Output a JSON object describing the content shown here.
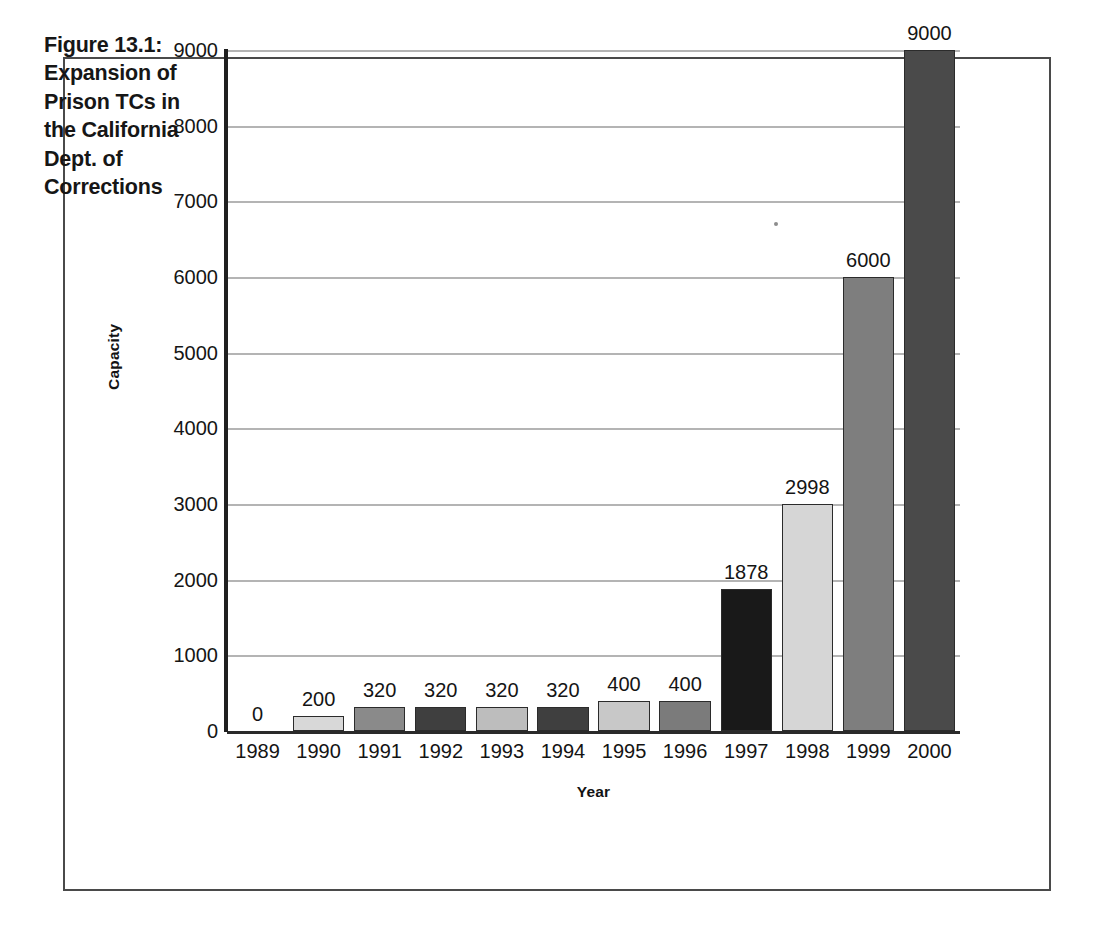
{
  "figure": {
    "title": "Figure 13.1: Expansion of Prison TCs in the California Dept. of Corrections"
  },
  "chart_data": {
    "type": "bar",
    "title": "Figure 13.1: Expansion of Prison TCs in the California Dept. of Corrections",
    "xlabel": "Year",
    "ylabel": "Capacity",
    "categories": [
      "1989",
      "1990",
      "1991",
      "1992",
      "1993",
      "1994",
      "1995",
      "1996",
      "1997",
      "1998",
      "1999",
      "2000"
    ],
    "values": [
      0,
      200,
      320,
      320,
      320,
      320,
      400,
      400,
      1878,
      2998,
      6000,
      9000
    ],
    "data_labels": [
      "0",
      "200",
      "320",
      "320",
      "320",
      "320",
      "400",
      "400",
      "1878",
      "2998",
      "6000",
      "9000"
    ],
    "bar_colors": [
      "#ffffff",
      "#d8d8d8",
      "#8a8a8a",
      "#3f3f3f",
      "#bdbdbd",
      "#3f3f3f",
      "#c8c8c8",
      "#7b7b7b",
      "#191919",
      "#d6d6d6",
      "#7e7e7e",
      "#4a4a4a"
    ],
    "ylim": [
      0,
      9000
    ],
    "y_ticks": [
      0,
      1000,
      2000,
      3000,
      4000,
      5000,
      6000,
      7000,
      8000,
      9000
    ],
    "y_tick_labels": [
      "0",
      "1000",
      "2000",
      "3000",
      "4000",
      "5000",
      "6000",
      "7000",
      "8000",
      "9000"
    ],
    "grid": true,
    "legend": false,
    "axis_color": "#1f1f1f",
    "gridline_color": "#b4b4b4",
    "frame_color": "#4a4a4a"
  }
}
